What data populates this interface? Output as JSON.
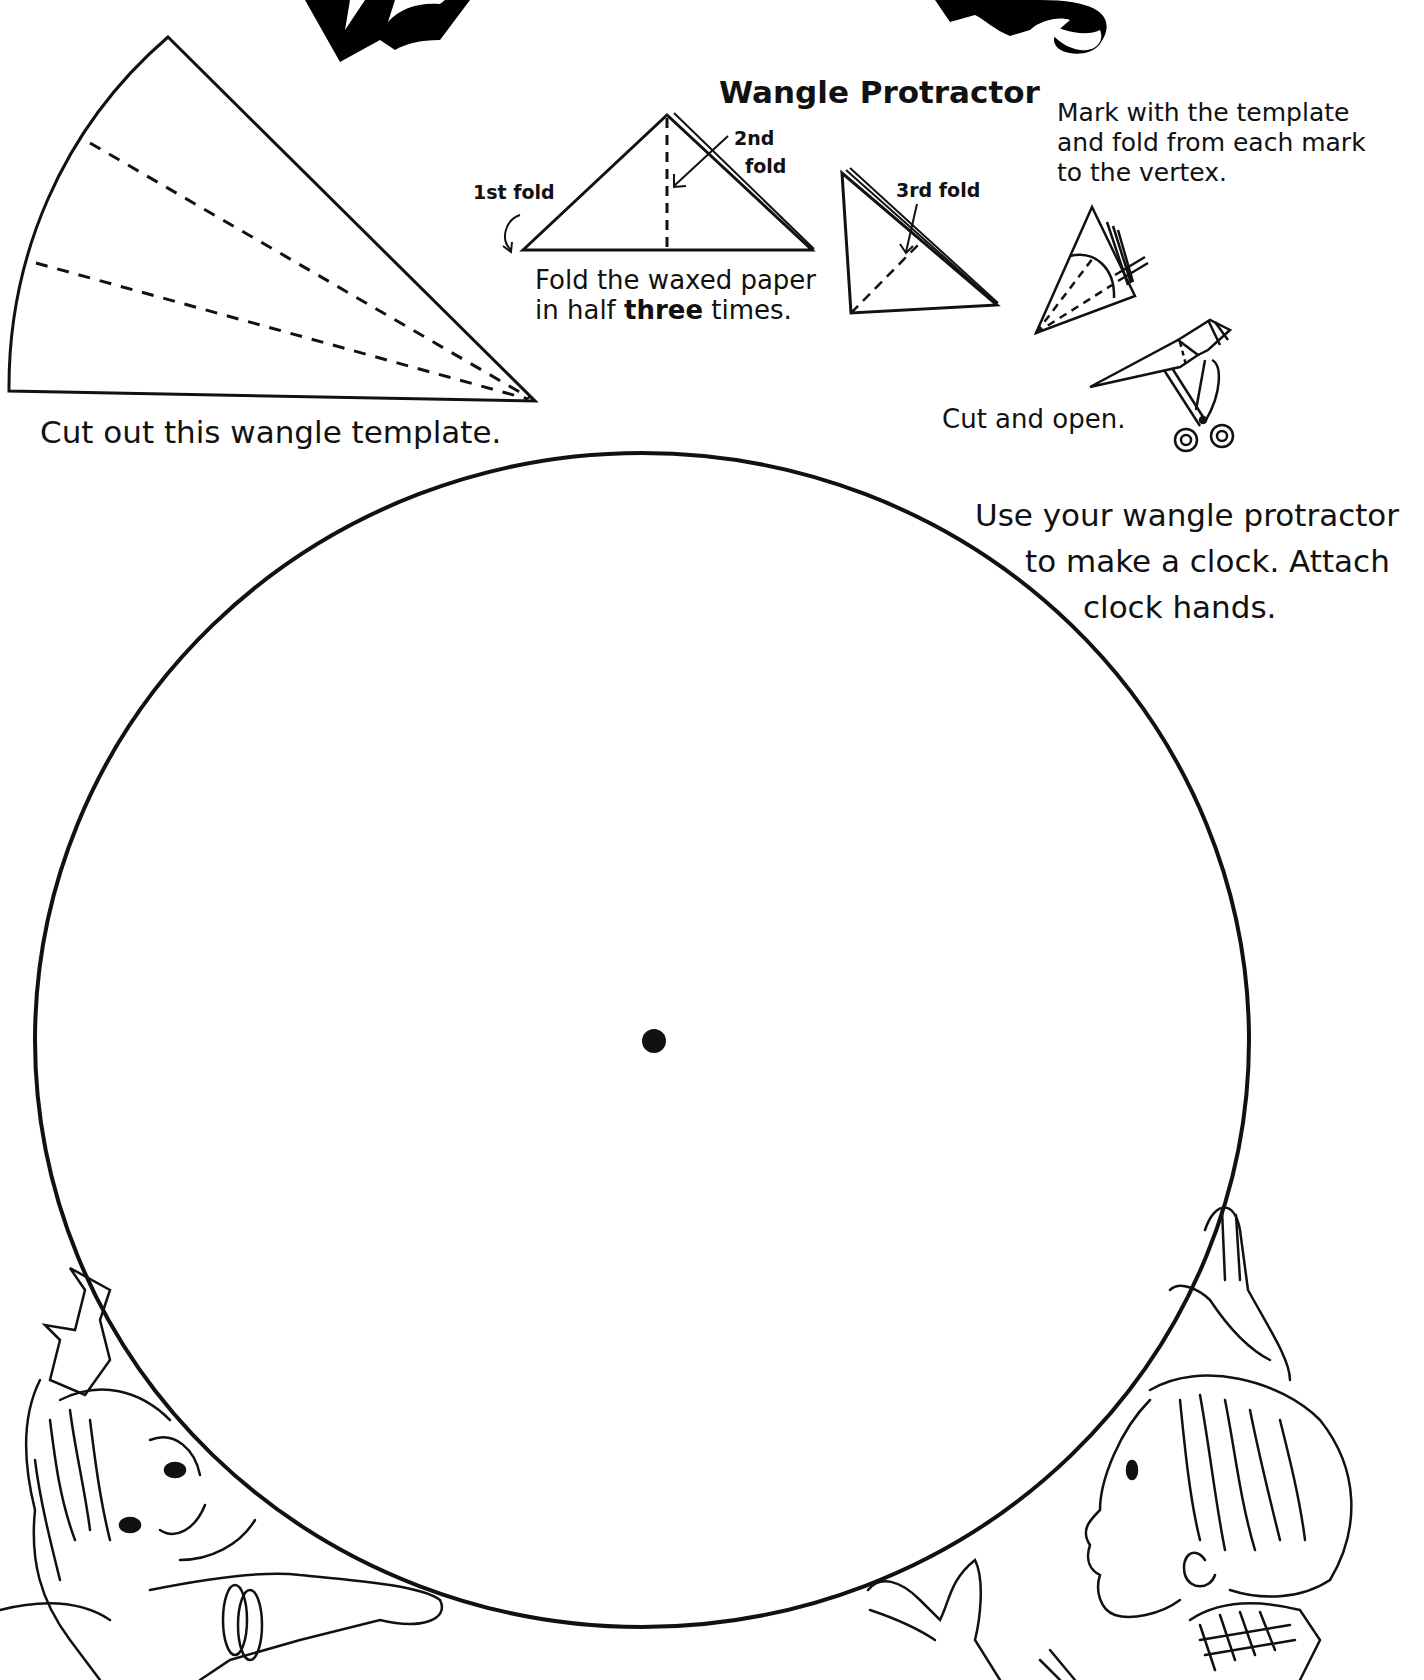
{
  "title": {
    "left_fragment": "Wa",
    "right_fragment": "gles"
  },
  "protractor": {
    "heading": "Wangle Protractor",
    "step1": {
      "fold1_label": "1st fold",
      "fold2_label_line1": "2nd",
      "fold2_label_line2": "fold",
      "instruction_line1": "Fold the waxed paper",
      "instruction_line2_prefix": "in half ",
      "instruction_line2_bold": "three",
      "instruction_line2_suffix": " times."
    },
    "step2": {
      "fold3_label": "3rd fold"
    },
    "step3": {
      "instruction_line1": "Mark with the template",
      "instruction_line2": "and fold from each mark",
      "instruction_line3": "to the vertex."
    },
    "step4": {
      "instruction": "Cut and open."
    }
  },
  "template": {
    "caption": "Cut out this wangle template."
  },
  "clock": {
    "instruction_line1": "Use your wangle protractor",
    "instruction_line2": "to make a clock. Attach",
    "instruction_line3": "clock hands."
  },
  "colors": {
    "ink": "#111111",
    "paper": "#ffffff"
  }
}
